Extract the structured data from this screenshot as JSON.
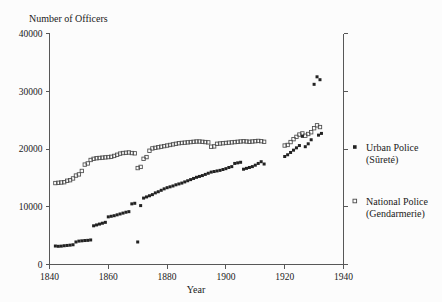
{
  "chart_data": {
    "type": "scatter",
    "title": "",
    "xlabel": "Year",
    "ylabel": "Number of Officers",
    "ylabel_position": "top-left",
    "xlim": [
      1840,
      1940
    ],
    "ylim": [
      0,
      40000
    ],
    "xticks": [
      1840,
      1860,
      1880,
      1900,
      1920,
      1940
    ],
    "xtick_labels": [
      "1840",
      "1860",
      "1880",
      "1900",
      "1920",
      "1940"
    ],
    "yticks": [
      0,
      10000,
      20000,
      30000,
      40000
    ],
    "ytick_labels": [
      "0",
      "10000",
      "20000",
      "30000",
      "40000"
    ],
    "grid": false,
    "legend_position": "right",
    "axes": {
      "left_spine": true,
      "bottom_spine": true,
      "right_spine": true,
      "top_spine": false
    },
    "series": [
      {
        "name": "Urban Police",
        "subname": "(Sûreté)",
        "legend_label": "Urban Police",
        "legend_sublabel": "(Sûreté)",
        "marker": "filled-square",
        "color": "#222222",
        "points": [
          [
            1842,
            3200
          ],
          [
            1843,
            3150
          ],
          [
            1844,
            3180
          ],
          [
            1845,
            3250
          ],
          [
            1846,
            3300
          ],
          [
            1847,
            3350
          ],
          [
            1848,
            3420
          ],
          [
            1849,
            3900
          ],
          [
            1850,
            4050
          ],
          [
            1851,
            4100
          ],
          [
            1852,
            4150
          ],
          [
            1853,
            4180
          ],
          [
            1854,
            4250
          ],
          [
            1855,
            6700
          ],
          [
            1856,
            6850
          ],
          [
            1857,
            7000
          ],
          [
            1858,
            7150
          ],
          [
            1859,
            7300
          ],
          [
            1860,
            8250
          ],
          [
            1861,
            8350
          ],
          [
            1862,
            8450
          ],
          [
            1863,
            8600
          ],
          [
            1864,
            8750
          ],
          [
            1865,
            8900
          ],
          [
            1866,
            9050
          ],
          [
            1867,
            9150
          ],
          [
            1868,
            10500
          ],
          [
            1869,
            10600
          ],
          [
            1870,
            3900
          ],
          [
            1871,
            10200
          ],
          [
            1872,
            11500
          ],
          [
            1873,
            11700
          ],
          [
            1874,
            11900
          ],
          [
            1875,
            12100
          ],
          [
            1876,
            12400
          ],
          [
            1877,
            12600
          ],
          [
            1878,
            12850
          ],
          [
            1879,
            13100
          ],
          [
            1880,
            13300
          ],
          [
            1881,
            13450
          ],
          [
            1882,
            13600
          ],
          [
            1883,
            13800
          ],
          [
            1884,
            13950
          ],
          [
            1885,
            14100
          ],
          [
            1886,
            14300
          ],
          [
            1887,
            14500
          ],
          [
            1888,
            14700
          ],
          [
            1889,
            14900
          ],
          [
            1890,
            15100
          ],
          [
            1891,
            15250
          ],
          [
            1892,
            15400
          ],
          [
            1893,
            15600
          ],
          [
            1894,
            15800
          ],
          [
            1895,
            16000
          ],
          [
            1896,
            16100
          ],
          [
            1897,
            16200
          ],
          [
            1898,
            16300
          ],
          [
            1899,
            16450
          ],
          [
            1900,
            16600
          ],
          [
            1901,
            16800
          ],
          [
            1902,
            16950
          ],
          [
            1903,
            17500
          ],
          [
            1904,
            17600
          ],
          [
            1905,
            17700
          ],
          [
            1906,
            16500
          ],
          [
            1907,
            16650
          ],
          [
            1908,
            16800
          ],
          [
            1909,
            16950
          ],
          [
            1910,
            17200
          ],
          [
            1911,
            17500
          ],
          [
            1912,
            17800
          ],
          [
            1913,
            17400
          ],
          [
            1920,
            18700
          ],
          [
            1921,
            19000
          ],
          [
            1922,
            19400
          ],
          [
            1923,
            19800
          ],
          [
            1924,
            20200
          ],
          [
            1925,
            20600
          ],
          [
            1926,
            22200
          ],
          [
            1927,
            20400
          ],
          [
            1928,
            20900
          ],
          [
            1929,
            21600
          ],
          [
            1930,
            31200
          ],
          [
            1931,
            32500
          ],
          [
            1932,
            32000
          ],
          [
            1931.5,
            22400
          ],
          [
            1932.5,
            22700
          ]
        ]
      },
      {
        "name": "National Police",
        "subname": "(Gendarmerie)",
        "legend_label": "National Police",
        "legend_sublabel": "(Gendarmerie)",
        "marker": "open-square",
        "color": "#4b4b4b",
        "points": [
          [
            1842,
            14100
          ],
          [
            1843,
            14150
          ],
          [
            1844,
            14200
          ],
          [
            1845,
            14250
          ],
          [
            1846,
            14500
          ],
          [
            1847,
            14600
          ],
          [
            1848,
            14900
          ],
          [
            1849,
            15400
          ],
          [
            1850,
            15600
          ],
          [
            1851,
            16200
          ],
          [
            1852,
            17300
          ],
          [
            1853,
            17500
          ],
          [
            1854,
            18100
          ],
          [
            1855,
            18300
          ],
          [
            1856,
            18400
          ],
          [
            1857,
            18450
          ],
          [
            1858,
            18500
          ],
          [
            1859,
            18550
          ],
          [
            1860,
            18600
          ],
          [
            1861,
            18650
          ],
          [
            1862,
            18800
          ],
          [
            1863,
            19000
          ],
          [
            1864,
            19200
          ],
          [
            1865,
            19300
          ],
          [
            1866,
            19350
          ],
          [
            1867,
            19400
          ],
          [
            1868,
            19300
          ],
          [
            1869,
            19250
          ],
          [
            1870,
            16700
          ],
          [
            1871,
            16900
          ],
          [
            1872,
            18300
          ],
          [
            1873,
            18600
          ],
          [
            1874,
            19700
          ],
          [
            1875,
            20100
          ],
          [
            1876,
            20200
          ],
          [
            1877,
            20300
          ],
          [
            1878,
            20400
          ],
          [
            1879,
            20500
          ],
          [
            1880,
            20600
          ],
          [
            1881,
            20700
          ],
          [
            1882,
            20800
          ],
          [
            1883,
            20900
          ],
          [
            1884,
            21000
          ],
          [
            1885,
            21050
          ],
          [
            1886,
            21100
          ],
          [
            1887,
            21150
          ],
          [
            1888,
            21200
          ],
          [
            1889,
            21250
          ],
          [
            1890,
            21300
          ],
          [
            1891,
            21300
          ],
          [
            1892,
            21250
          ],
          [
            1893,
            21200
          ],
          [
            1894,
            21150
          ],
          [
            1895,
            20400
          ],
          [
            1896,
            20450
          ],
          [
            1897,
            20900
          ],
          [
            1898,
            20950
          ],
          [
            1899,
            21000
          ],
          [
            1900,
            21050
          ],
          [
            1901,
            21100
          ],
          [
            1902,
            21150
          ],
          [
            1903,
            21200
          ],
          [
            1904,
            21250
          ],
          [
            1905,
            21300
          ],
          [
            1906,
            21350
          ],
          [
            1907,
            21300
          ],
          [
            1908,
            21250
          ],
          [
            1909,
            21300
          ],
          [
            1910,
            21350
          ],
          [
            1911,
            21400
          ],
          [
            1912,
            21350
          ],
          [
            1913,
            21250
          ],
          [
            1920,
            20600
          ],
          [
            1921,
            20700
          ],
          [
            1922,
            21200
          ],
          [
            1923,
            21700
          ],
          [
            1924,
            22100
          ],
          [
            1925,
            22500
          ],
          [
            1926,
            22700
          ],
          [
            1927,
            22300
          ],
          [
            1928,
            22600
          ],
          [
            1929,
            22900
          ],
          [
            1930,
            23600
          ],
          [
            1931,
            24100
          ],
          [
            1932,
            23800
          ]
        ]
      }
    ]
  },
  "legend": {
    "entries": [
      {
        "label": "Urban Police",
        "sublabel": "(Sûreté)",
        "marker": "filled-square"
      },
      {
        "label": "National Police",
        "sublabel": "(Gendarmerie)",
        "marker": "open-square"
      }
    ]
  }
}
